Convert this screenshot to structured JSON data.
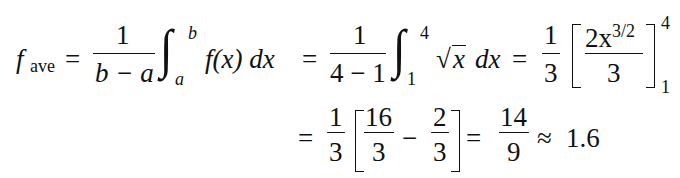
{
  "equation": {
    "line1": {
      "lhs": {
        "f": "f",
        "sub": "ave"
      },
      "eq1": "=",
      "frac1": {
        "num": "1",
        "den": "b − a"
      },
      "integral1": {
        "symbol": "∫",
        "upper": "b",
        "lower": "a",
        "integrand": "f(x) dx"
      },
      "eq2": "=",
      "frac2": {
        "num": "1",
        "den": "4 − 1"
      },
      "integral2": {
        "symbol": "∫",
        "upper": "4",
        "lower": "1",
        "sqrt": "√",
        "radicand": "x",
        "dx": "dx"
      },
      "eq3": "=",
      "frac3": {
        "num": "1",
        "den": "3"
      },
      "bracket": {
        "num_coef": "2x",
        "num_exp": "3/2",
        "den": "3",
        "upper": "4",
        "lower": "1"
      }
    },
    "line2": {
      "eq": "=",
      "frac_a": {
        "num": "1",
        "den": "3"
      },
      "frac_b": {
        "num": "16",
        "den": "3"
      },
      "minus": "−",
      "frac_c": {
        "num": "2",
        "den": "3"
      },
      "eq2": "=",
      "frac_d": {
        "num": "14",
        "den": "9"
      },
      "approx": "≈",
      "result": "1.6"
    }
  }
}
